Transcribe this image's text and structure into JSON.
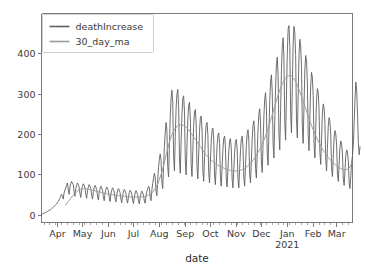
{
  "chart_data": {
    "type": "line",
    "title": "",
    "xlabel": "date",
    "ylabel": "",
    "grid": false,
    "legend_position": "upper left",
    "ylim": [
      -18,
      500
    ],
    "yticks": [
      0,
      100,
      200,
      300,
      400
    ],
    "ytick_labels": [
      "0",
      "100",
      "200",
      "300",
      "400"
    ],
    "xtick_labels": [
      "Apr",
      "May",
      "Jun",
      "Jul",
      "Aug",
      "Sep",
      "Oct",
      "Nov",
      "Dec",
      "Jan",
      "Feb",
      "Mar"
    ],
    "xtick_sub_labels": [
      "",
      "",
      "",
      "",
      "",
      "",
      "",
      "",
      "",
      "2021",
      "",
      ""
    ],
    "xtick_positions_days": [
      19,
      49,
      80,
      110,
      141,
      172,
      202,
      233,
      263,
      294,
      325,
      353
    ],
    "x_range_days": [
      0,
      372
    ],
    "x_start_label": "2020-03-13",
    "x_end_label": "2021-03-20",
    "colors": {
      "deathIncrease": "#5f5f5f",
      "30_day_ma": "#9a9a9a",
      "axis": "#7b7b7b",
      "text": "#3a3a3a",
      "background": "#ffffff"
    },
    "series": [
      {
        "name": "deathIncrease",
        "color": "#5f5f5f",
        "linewidth": 0.9,
        "values": [
          2,
          3,
          4,
          5,
          6,
          7,
          8,
          9,
          11,
          12,
          13,
          14,
          16,
          18,
          20,
          22,
          24,
          26,
          28,
          31,
          34,
          38,
          42,
          47,
          52,
          48,
          40,
          55,
          62,
          68,
          74,
          80,
          64,
          52,
          70,
          78,
          84,
          80,
          76,
          58,
          47,
          66,
          74,
          80,
          76,
          70,
          54,
          44,
          62,
          72,
          78,
          74,
          68,
          52,
          42,
          60,
          70,
          76,
          72,
          66,
          50,
          40,
          58,
          68,
          74,
          70,
          64,
          48,
          38,
          56,
          66,
          72,
          68,
          62,
          46,
          36,
          54,
          64,
          70,
          66,
          60,
          44,
          34,
          52,
          62,
          68,
          64,
          58,
          42,
          33,
          50,
          60,
          66,
          62,
          56,
          40,
          31,
          48,
          58,
          64,
          60,
          54,
          38,
          30,
          46,
          56,
          62,
          58,
          52,
          37,
          29,
          45,
          55,
          61,
          57,
          51,
          36,
          28,
          44,
          54,
          60,
          56,
          50,
          35,
          30,
          48,
          58,
          66,
          72,
          68,
          44,
          36,
          62,
          78,
          92,
          104,
          96,
          60,
          48,
          86,
          118,
          140,
          152,
          136,
          82,
          66,
          120,
          170,
          205,
          230,
          210,
          120,
          95,
          175,
          245,
          290,
          310,
          280,
          150,
          110,
          195,
          265,
          300,
          312,
          272,
          142,
          104,
          182,
          250,
          288,
          296,
          258,
          136,
          100,
          172,
          236,
          272,
          280,
          244,
          128,
          96,
          160,
          222,
          256,
          262,
          228,
          120,
          90,
          150,
          208,
          240,
          246,
          214,
          112,
          84,
          140,
          194,
          224,
          230,
          200,
          106,
          80,
          132,
          182,
          210,
          216,
          188,
          100,
          76,
          124,
          172,
          198,
          204,
          178,
          95,
          72,
          118,
          164,
          190,
          196,
          170,
          92,
          70,
          114,
          158,
          184,
          190,
          166,
          90,
          68,
          112,
          156,
          182,
          188,
          164,
          89,
          68,
          114,
          160,
          188,
          196,
          172,
          94,
          72,
          122,
          172,
          202,
          212,
          186,
          102,
          80,
          134,
          188,
          222,
          234,
          206,
          116,
          92,
          152,
          212,
          250,
          264,
          232,
          132,
          106,
          176,
          244,
          288,
          304,
          268,
          154,
          124,
          204,
          282,
          330,
          348,
          306,
          178,
          142,
          232,
          318,
          372,
          392,
          346,
          202,
          162,
          262,
          358,
          418,
          440,
          390,
          230,
          186,
          296,
          400,
          462,
          470,
          418,
          252,
          204,
          318,
          424,
          468,
          452,
          396,
          238,
          192,
          298,
          396,
          436,
          420,
          366,
          220,
          178,
          272,
          360,
          396,
          382,
          332,
          200,
          160,
          244,
          322,
          354,
          342,
          296,
          178,
          142,
          216,
          286,
          314,
          304,
          262,
          156,
          126,
          190,
          252,
          276,
          266,
          230,
          136,
          110,
          166,
          220,
          242,
          232,
          200,
          118,
          96,
          144,
          192,
          210,
          202,
          174,
          102,
          84,
          126,
          168,
          184,
          176,
          152,
          90,
          74,
          110,
          148,
          162,
          156,
          134,
          80,
          66,
          98,
          132,
          148,
          176,
          230,
          290,
          330,
          310,
          250,
          180,
          150,
          170
        ]
      },
      {
        "name": "30_day_ma",
        "color": "#9a9a9a",
        "linewidth": 1.0,
        "values": [
          null,
          null,
          null,
          null,
          null,
          null,
          null,
          null,
          null,
          null,
          null,
          null,
          null,
          null,
          null,
          null,
          null,
          null,
          null,
          null,
          null,
          null,
          null,
          null,
          null,
          null,
          null,
          null,
          null,
          25,
          28,
          31,
          34,
          36,
          39,
          42,
          45,
          48,
          50,
          52,
          54,
          56,
          58,
          60,
          62,
          63,
          64,
          64,
          65,
          65,
          66,
          66,
          66,
          65,
          65,
          64,
          64,
          64,
          63,
          63,
          62,
          62,
          61,
          61,
          60,
          60,
          59,
          59,
          58,
          58,
          57,
          57,
          56,
          56,
          55,
          55,
          54,
          54,
          53,
          53,
          52,
          52,
          52,
          51,
          51,
          51,
          50,
          50,
          50,
          49,
          49,
          49,
          49,
          48,
          48,
          48,
          48,
          47,
          47,
          47,
          47,
          47,
          46,
          46,
          46,
          46,
          46,
          46,
          45,
          45,
          45,
          45,
          45,
          45,
          45,
          45,
          45,
          45,
          45,
          45,
          46,
          46,
          46,
          46,
          47,
          47,
          48,
          49,
          50,
          51,
          52,
          53,
          55,
          57,
          60,
          63,
          66,
          69,
          73,
          78,
          83,
          89,
          95,
          101,
          108,
          115,
          123,
          131,
          140,
          149,
          158,
          166,
          174,
          181,
          188,
          194,
          199,
          204,
          208,
          212,
          215,
          218,
          220,
          222,
          223,
          224,
          224,
          224,
          224,
          223,
          222,
          221,
          220,
          218,
          216,
          214,
          212,
          209,
          206,
          203,
          200,
          197,
          194,
          191,
          188,
          185,
          182,
          179,
          176,
          173,
          170,
          167,
          164,
          161,
          158,
          155,
          152,
          150,
          147,
          145,
          143,
          141,
          139,
          137,
          135,
          133,
          131,
          129,
          128,
          126,
          125,
          124,
          123,
          122,
          121,
          120,
          119,
          118,
          117,
          116,
          115,
          114,
          114,
          113,
          112,
          112,
          111,
          111,
          110,
          110,
          110,
          110,
          110,
          110,
          110,
          110,
          110,
          111,
          111,
          112,
          113,
          114,
          115,
          116,
          118,
          119,
          121,
          123,
          125,
          127,
          129,
          131,
          134,
          136,
          139,
          142,
          145,
          148,
          152,
          155,
          159,
          163,
          167,
          171,
          176,
          181,
          186,
          191,
          197,
          203,
          209,
          215,
          222,
          228,
          235,
          242,
          249,
          256,
          263,
          270,
          277,
          284,
          291,
          298,
          304,
          310,
          316,
          321,
          326,
          330,
          334,
          337,
          340,
          342,
          344,
          345,
          346,
          346,
          346,
          345,
          343,
          341,
          338,
          335,
          331,
          327,
          322,
          317,
          312,
          306,
          300,
          294,
          288,
          282,
          276,
          270,
          264,
          258,
          252,
          246,
          240,
          234,
          228,
          222,
          217,
          212,
          207,
          202,
          197,
          192,
          188,
          184,
          180,
          176,
          172,
          168,
          164,
          161,
          158,
          155,
          152,
          149,
          146,
          143,
          140,
          138,
          136,
          134,
          132,
          130,
          128,
          126,
          124,
          122,
          120,
          119,
          118,
          117,
          116,
          115,
          114,
          113,
          113,
          113,
          113,
          113,
          114,
          115,
          117,
          120,
          124,
          129
        ]
      }
    ]
  },
  "legend": {
    "entries": [
      {
        "label": "deathIncrease"
      },
      {
        "label": "30_day_ma"
      }
    ]
  },
  "axes": {
    "xlabel": "date",
    "year_annotation": "2021"
  }
}
